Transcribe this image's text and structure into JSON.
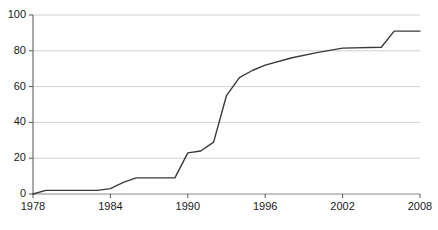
{
  "chart_data": {
    "type": "line",
    "title": "",
    "xlabel": "",
    "ylabel": "",
    "xlim": [
      1978,
      2008
    ],
    "ylim": [
      0,
      100
    ],
    "grid": true,
    "legend": null,
    "xticks": [
      1978,
      1984,
      1990,
      1996,
      2002,
      2008
    ],
    "xtick_labels": [
      "1978",
      "1984",
      "1990",
      "1996",
      "2002",
      "2008"
    ],
    "yticks": [
      0,
      20,
      40,
      60,
      80,
      100
    ],
    "ytick_labels": [
      "0",
      "20",
      "40",
      "60",
      "80",
      "100"
    ],
    "series": [
      {
        "name": "",
        "color": "#3a3a3a",
        "x": [
          1978,
          1979,
          1983,
          1984,
          1985,
          1986,
          1989,
          1990,
          1991,
          1992,
          1993,
          1994,
          1995,
          1996,
          1998,
          2000,
          2002,
          2005,
          2006,
          2008
        ],
        "values": [
          0,
          2,
          2,
          3,
          6.5,
          9,
          9,
          23,
          24,
          29,
          55,
          65,
          69,
          72,
          76,
          79,
          81.5,
          82,
          91,
          91
        ]
      }
    ]
  },
  "axis": {
    "y_title": "",
    "x_title": ""
  }
}
